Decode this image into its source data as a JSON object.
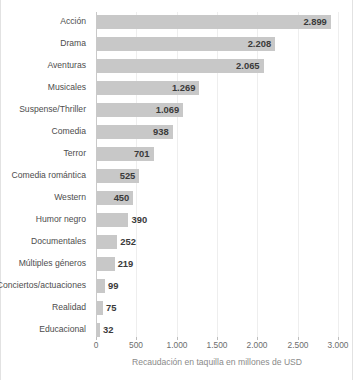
{
  "chart_data": {
    "type": "bar",
    "orientation": "horizontal",
    "title": "",
    "subtitle": "",
    "xlabel": "Recaudación en taquilla en millones de USD",
    "ylabel": "",
    "xlim": [
      0,
      3000
    ],
    "xticks": [
      "0",
      "500",
      "1.000",
      "1.500",
      "2.000",
      "2.500",
      "3.000"
    ],
    "xtick_values": [
      0,
      500,
      1000,
      1500,
      2000,
      2500,
      3000
    ],
    "grid": true,
    "grid_axis": "x",
    "legend": "none",
    "bar_color": "#c8c8c8",
    "label_color": "#3a3a3a",
    "categories": [
      "Acción",
      "Drama",
      "Aventuras",
      "Musicales",
      "Suspense/Thriller",
      "Comedia",
      "Terror",
      "Comedia romántica",
      "Western",
      "Humor negro",
      "Documentales",
      "Múltiples géneros",
      "Conciertos/actuaciones",
      "Realidad",
      "Educacional"
    ],
    "values": [
      2899,
      2208,
      2065,
      1269,
      1069,
      938,
      701,
      525,
      450,
      390,
      252,
      219,
      99,
      75,
      32
    ],
    "value_labels": [
      "2.899",
      "2.208",
      "2.065",
      "1.269",
      "1.069",
      "938",
      "701",
      "525",
      "450",
      "390",
      "252",
      "219",
      "99",
      "75",
      "32"
    ]
  }
}
